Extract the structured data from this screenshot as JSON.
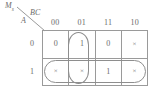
{
  "diagram": {
    "type": "karnaugh-map",
    "output_label": "Ms",
    "output_label_base": "M",
    "output_label_subscript": "s",
    "column_variable": "BC",
    "row_variable": "A",
    "column_headers": [
      "00",
      "01",
      "11",
      "10"
    ],
    "row_headers": [
      "0",
      "1"
    ],
    "dont_care_symbol": "×",
    "rows": [
      {
        "row_label": "0",
        "cells": [
          {
            "value": "0",
            "kind": "zero"
          },
          {
            "value": "1",
            "kind": "one"
          },
          {
            "value": "0",
            "kind": "zero"
          },
          {
            "value": "×",
            "kind": "dont-care"
          }
        ]
      },
      {
        "row_label": "1",
        "cells": [
          {
            "value": "×",
            "kind": "dont-care"
          },
          {
            "value": "×",
            "kind": "dont-care"
          },
          {
            "value": "1",
            "kind": "one"
          },
          {
            "value": "×",
            "kind": "dont-care"
          }
        ]
      }
    ],
    "groups": [
      {
        "name": "column-01-group",
        "orientation": "vertical",
        "covers_columns": [
          "01"
        ],
        "covers_rows": [
          "0",
          "1"
        ]
      },
      {
        "name": "row-A1-group",
        "orientation": "horizontal",
        "covers_columns": [
          "00",
          "01",
          "11",
          "10"
        ],
        "covers_rows": [
          "1"
        ]
      }
    ],
    "colors": {
      "line": "#9a9a9a",
      "group_outline": "#8e8e8e",
      "text": "#6b6b6b",
      "background": "#ffffff"
    }
  }
}
